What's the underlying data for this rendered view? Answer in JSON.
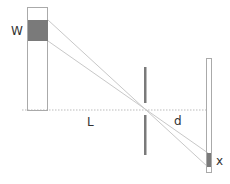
{
  "diagram": {
    "type": "single-slit / pinhole projection geometry",
    "labels": {
      "source_width": "W",
      "source_to_aperture": "L",
      "aperture_to_screen": "d",
      "image_width": "x"
    },
    "colors": {
      "outline": "#aaaaaa",
      "fill_block": "#7a7a7a",
      "barrier": "#7a7a7a",
      "rays": "#c8c8c8",
      "axis": "#bbbbbb",
      "text": "#333333"
    }
  }
}
